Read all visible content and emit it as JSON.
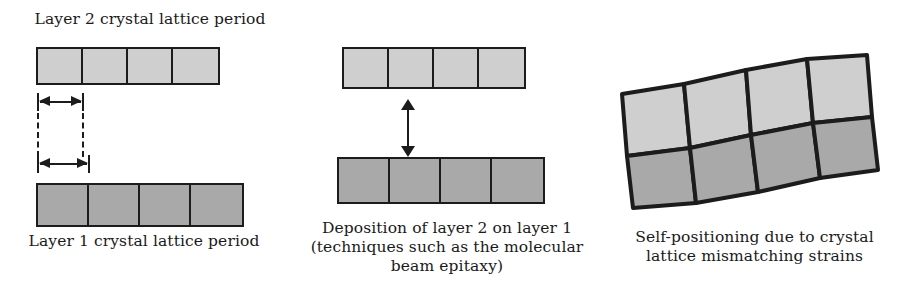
{
  "figure": {
    "colors": {
      "layer2_fill": "#cfcfcf",
      "layer1_fill": "#a9a9a9",
      "outline": "#1c1c1c",
      "background": "#ffffff",
      "text": "#1a1a1a"
    }
  },
  "panels": {
    "left": {
      "name": "lattice-period-comparison",
      "top_label": "Layer 2 crystal lattice period",
      "bottom_label": "Layer 1 crystal lattice period",
      "layer2": {
        "label": "Layer 2",
        "cell_count": 4,
        "fill": "#cfcfcf",
        "period_px": 46
      },
      "layer1": {
        "label": "Layer 1",
        "cell_count": 4,
        "fill": "#a9a9a9",
        "period_px": 52
      },
      "measure_top": {
        "name": "layer-2-period-arrow",
        "width_px": 46
      },
      "measure_bottom": {
        "name": "layer-1-period-arrow",
        "width_px": 52
      }
    },
    "middle": {
      "name": "deposition-step",
      "caption": "Deposition of layer 2 on layer 1\n(techniques such as the molecular\nbeam epitaxy)",
      "caption_lines": [
        "Deposition of layer 2 on layer 1",
        "(techniques such as the molecular",
        "beam epitaxy)"
      ],
      "layer2": {
        "label": "Layer 2",
        "cell_count": 4,
        "fill": "#cfcfcf"
      },
      "layer1": {
        "label": "Layer 1",
        "cell_count": 4,
        "fill": "#a9a9a9"
      },
      "arrow": {
        "name": "deposition-direction-arrow",
        "style": "double-headed-vertical"
      }
    },
    "right": {
      "name": "strained-lattice-result",
      "caption": "Self-positioning due to crystal\nlattice mismatching strains",
      "caption_lines": [
        "Self-positioning due to crystal",
        "lattice mismatching strains"
      ],
      "lattice": {
        "columns": 4,
        "rows": 2,
        "top_row_fill": "#cfcfcf",
        "bottom_row_fill": "#a9a9a9",
        "deformation": "curved upward arch, tilted"
      }
    }
  }
}
